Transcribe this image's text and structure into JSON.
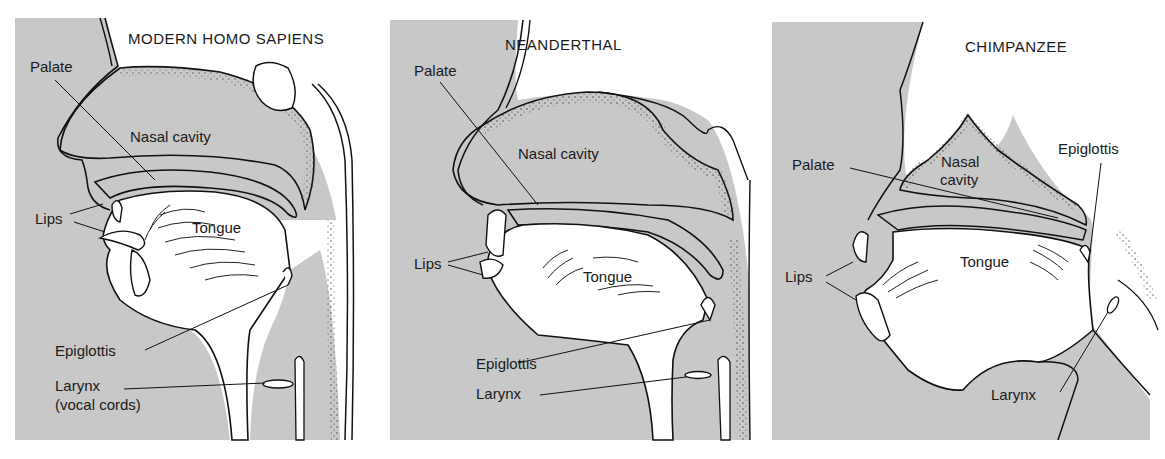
{
  "figure": {
    "colors": {
      "tissue_gray": "#c8c8c8",
      "cavity_white": "#ffffff",
      "outline": "#111111",
      "stipple": "#333333"
    },
    "panels": [
      {
        "title": "MODERN HOMO SAPIENS",
        "labels": {
          "palate": "Palate",
          "nasal_cavity": "Nasal cavity",
          "lips": "Lips",
          "tongue": "Tongue",
          "epiglottis": "Epiglottis",
          "larynx": "Larynx",
          "larynx_note": "(vocal cords)"
        }
      },
      {
        "title": "NEANDERTHAL",
        "labels": {
          "palate": "Palate",
          "nasal_cavity": "Nasal cavity",
          "lips": "Lips",
          "tongue": "Tongue",
          "epiglottis": "Epiglottis",
          "larynx": "Larynx"
        }
      },
      {
        "title": "CHIMPANZEE",
        "labels": {
          "palate": "Palate",
          "nasal_cavity_line1": "Nasal",
          "nasal_cavity_line2": "cavity",
          "epiglottis": "Epiglottis",
          "lips": "Lips",
          "tongue": "Tongue",
          "larynx": "Larynx"
        }
      }
    ]
  }
}
